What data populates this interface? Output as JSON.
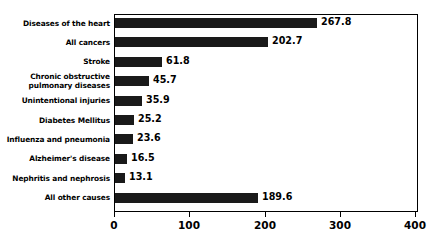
{
  "chart_data": {
    "type": "bar",
    "orientation": "horizontal",
    "title": "",
    "xlabel": "",
    "ylabel": "",
    "xlim": [
      0,
      400
    ],
    "grid": false,
    "legend": null,
    "bar_color": "#1a1a1a",
    "background_color": "#ffffff",
    "xticks": [
      0,
      100,
      200,
      300,
      400
    ],
    "xtick_labels": [
      "0",
      "100",
      "200",
      "300",
      "400"
    ],
    "categories": [
      "Diseases of the heart",
      "All cancers",
      "Stroke",
      "Chronic obstructive\npulmonary diseases",
      "Unintentional injuries",
      "Diabetes Mellitus",
      "Influenza and pneumonia",
      "Alzheimer's disease",
      "Nephritis and nephrosis",
      "All other causes"
    ],
    "values": [
      267.8,
      202.7,
      61.8,
      45.7,
      35.9,
      25.2,
      23.6,
      16.5,
      13.1,
      189.6
    ],
    "value_labels": [
      "267.8",
      "202.7",
      "61.8",
      "45.7",
      "35.9",
      "25.2",
      "23.6",
      "16.5",
      "13.1",
      "189.6"
    ]
  }
}
